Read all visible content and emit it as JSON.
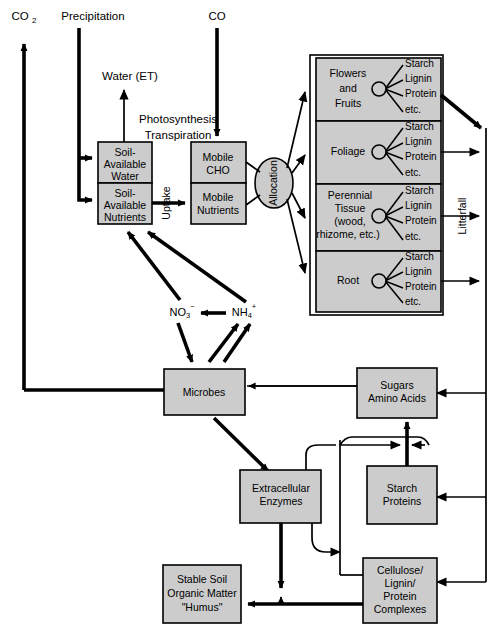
{
  "diagram": {
    "top_labels": {
      "co2_left": "CO2",
      "precipitation": "Precipitation",
      "water_et": "Water (ET)",
      "photosynthesis": "Photosynthesis",
      "transpiration": "Transpiration",
      "co2_right": "CO2"
    },
    "soil_boxes": [
      {
        "id": "soil-available-water",
        "lines": [
          "Soil-",
          "Available",
          "Water"
        ]
      },
      {
        "id": "soil-available-nutrients",
        "lines": [
          "Soil-",
          "Available",
          "Nutrients"
        ]
      }
    ],
    "mobile_boxes": [
      {
        "id": "mobile-cho",
        "lines": [
          "Mobile",
          "CHO"
        ]
      },
      {
        "id": "mobile-nutrients",
        "lines": [
          "Mobile",
          "Nutrients"
        ]
      }
    ],
    "uptake_label": "Uptake",
    "allocation_label": "Allocation",
    "litterfall_label": "Litterfall",
    "plant_compartments": [
      {
        "id": "flowers-and-fruits",
        "lines": [
          "Flowers",
          "and",
          "Fruits"
        ],
        "constituents": [
          "Starch",
          "Lignin",
          "Protein",
          "etc."
        ]
      },
      {
        "id": "foliage",
        "lines": [
          "Foliage"
        ],
        "constituents": [
          "Starch",
          "Lignin",
          "Protein",
          "etc."
        ]
      },
      {
        "id": "perennial-tissue",
        "lines": [
          "Perennial",
          "Tissue",
          "(wood,",
          "rhizome, etc.)"
        ],
        "constituents": [
          "Starch",
          "Lignin",
          "Protein",
          "etc."
        ]
      },
      {
        "id": "root",
        "lines": [
          "Root"
        ],
        "constituents": [
          "Starch",
          "Lignin",
          "Protein",
          "etc."
        ]
      }
    ],
    "ions": {
      "nitrate": {
        "base": "NO",
        "sub": "3",
        "sup": "−"
      },
      "ammonium": {
        "base": "NH",
        "sub": "4",
        "sup": "+"
      }
    },
    "soil_boxes_lower": [
      {
        "id": "microbes",
        "lines": [
          "Microbes"
        ]
      },
      {
        "id": "sugars-amino-acids",
        "lines": [
          "Sugars",
          "Amino Acids"
        ]
      },
      {
        "id": "extracellular-enzymes",
        "lines": [
          "Extracellular",
          "Enzymes"
        ]
      },
      {
        "id": "starch-proteins",
        "lines": [
          "Starch",
          "Proteins"
        ]
      },
      {
        "id": "stable-soil-organic-matter",
        "lines": [
          "Stable Soil",
          "Organic Matter",
          "\"Humus\""
        ]
      },
      {
        "id": "cellulose-lignin-protein-complexes",
        "lines": [
          "Cellulose/",
          "Lignin/",
          "Protein",
          "Complexes"
        ]
      }
    ],
    "colors": {
      "box_fill": "#cccccc",
      "stroke": "#000000",
      "background": "#ffffff"
    }
  }
}
